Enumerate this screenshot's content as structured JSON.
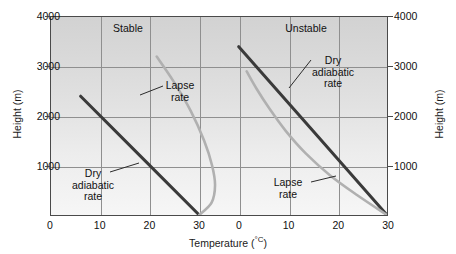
{
  "chart_data": {
    "type": "line",
    "title": "",
    "xlabel": "Temperature (°C)",
    "ylabel": "Height (m)",
    "xlim": [
      0,
      68
    ],
    "ylim": [
      0,
      4000
    ],
    "grid": true,
    "legend": "none",
    "panels": [
      {
        "name": "Stable",
        "label": "Stable",
        "x_offset": 0,
        "series": [
          {
            "name": "Dry adiabatic rate",
            "label": "Dry\nadiabatic\nrate",
            "color": "#3a3a3a",
            "width": 3.0,
            "points": [
              [
                30,
                0
              ],
              [
                6,
                2400
              ]
            ]
          },
          {
            "name": "Lapse rate",
            "label": "Lapse\nrate",
            "color": "#b0b0b0",
            "width": 2.6,
            "points": [
              [
                30,
                0
              ],
              [
                32.5,
                250
              ],
              [
                33.2,
                600
              ],
              [
                32.6,
                1000
              ],
              [
                31.0,
                1500
              ],
              [
                28.3,
                2100
              ],
              [
                24.8,
                2700
              ],
              [
                21.4,
                3200
              ]
            ]
          }
        ]
      },
      {
        "name": "Unstable",
        "label": "Unstable",
        "x_offset": 38,
        "series": [
          {
            "name": "Dry adiabatic rate",
            "label": "Dry\nadiabatic\nrate",
            "color": "#3a3a3a",
            "width": 3.0,
            "points": [
              [
                30,
                0
              ],
              [
                0,
                3400
              ]
            ]
          },
          {
            "name": "Lapse rate",
            "label": "Lapse\nrate",
            "color": "#b0b0b0",
            "width": 2.6,
            "points": [
              [
                30,
                0
              ],
              [
                24.0,
                400
              ],
              [
                18.5,
                800
              ],
              [
                13.5,
                1250
              ],
              [
                9.5,
                1700
              ],
              [
                6.2,
                2150
              ],
              [
                3.6,
                2550
              ],
              [
                1.6,
                2900
              ]
            ]
          }
        ]
      }
    ],
    "y_ticks": [
      1000,
      2000,
      3000,
      4000
    ],
    "y_tick_labels": [
      "1000",
      "2000",
      "3000",
      "4000"
    ],
    "x_ticks_left": [
      0,
      10,
      20,
      30
    ],
    "x_tick_labels_left": [
      "0",
      "10",
      "20",
      "30"
    ],
    "x_ticks_right": [
      0,
      10,
      20,
      30
    ],
    "x_tick_labels_right": [
      "0",
      "10",
      "20",
      "30"
    ],
    "colors": {
      "dry_adiabatic": "#3a3a3a",
      "lapse_rate": "#b0b0b0",
      "grid": "#8f8f8f",
      "frame": "#4a4a4a",
      "background_top": "#d2d2d2",
      "background_bottom": "#f6f6f6"
    }
  },
  "axes": {
    "x_title_text": "Temperature (",
    "x_title_unit": "°C",
    "x_title_close": ")",
    "y_title_left": "Height (m)",
    "y_title_right": "Height (m)"
  },
  "labels": {
    "stable_title": "Stable",
    "unstable_title": "Unstable",
    "stable_lapse_line1": "Lapse",
    "stable_lapse_line2": "rate",
    "stable_dry_line1": "Dry",
    "stable_dry_line2": "adiabatic",
    "stable_dry_line3": "rate",
    "unstable_dry_line1": "Dry",
    "unstable_dry_line2": "adiabatic",
    "unstable_dry_line3": "rate",
    "unstable_lapse_line1": "Lapse",
    "unstable_lapse_line2": "rate"
  }
}
